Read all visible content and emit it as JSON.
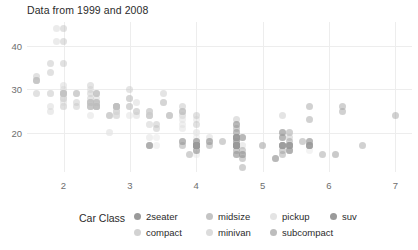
{
  "title": "Data from 1999 and 2008",
  "legend": {
    "title": "Car Class",
    "items": [
      {
        "label": "2seater",
        "color": "#9a9a9a",
        "col": 0,
        "row": 0
      },
      {
        "label": "compact",
        "color": "#d2d2d2",
        "col": 0,
        "row": 1
      },
      {
        "label": "midsize",
        "color": "#c4c4c4",
        "col": 1,
        "row": 0
      },
      {
        "label": "minivan",
        "color": "#dcdcdc",
        "col": 1,
        "row": 1
      },
      {
        "label": "pickup",
        "color": "#e4e4e4",
        "col": 2,
        "row": 0
      },
      {
        "label": "subcompact",
        "color": "#bdbdbd",
        "col": 2,
        "row": 1
      },
      {
        "label": "suv",
        "color": "#9a9a9a",
        "col": 3,
        "row": 0
      }
    ]
  },
  "chart_data": {
    "type": "scatter",
    "title": "Data from 1999 and 2008",
    "xlabel": "",
    "ylabel": "",
    "xlim": [
      1.45,
      7.25
    ],
    "ylim": [
      11.0,
      45.5
    ],
    "xticks": [
      2,
      3,
      4,
      5,
      6,
      7
    ],
    "yticks": [
      20,
      30,
      40
    ],
    "grid": true,
    "legend_position": "bottom",
    "legend_title": "Car Class",
    "point_opacity": 0.45,
    "series": [
      {
        "name": "2seater",
        "color": "#9a9a9a",
        "points": [
          [
            5.7,
            26
          ],
          [
            5.7,
            23
          ],
          [
            6.2,
            26
          ],
          [
            6.2,
            25
          ],
          [
            7.0,
            24
          ]
        ]
      },
      {
        "name": "compact",
        "color": "#d2d2d2",
        "points": [
          [
            1.8,
            29
          ],
          [
            1.8,
            29
          ],
          [
            2.0,
            31
          ],
          [
            2.0,
            30
          ],
          [
            2.8,
            26
          ],
          [
            2.8,
            26
          ],
          [
            3.1,
            27
          ],
          [
            1.8,
            26
          ],
          [
            1.8,
            25
          ],
          [
            2.0,
            28
          ],
          [
            2.0,
            27
          ],
          [
            2.8,
            25
          ],
          [
            2.8,
            25
          ],
          [
            3.1,
            25
          ],
          [
            3.1,
            24
          ],
          [
            2.4,
            27
          ],
          [
            2.4,
            30
          ],
          [
            2.5,
            26
          ],
          [
            2.5,
            29
          ],
          [
            3.3,
            17
          ],
          [
            2.0,
            28
          ],
          [
            2.0,
            29
          ],
          [
            2.0,
            29
          ],
          [
            2.0,
            28
          ],
          [
            2.8,
            24
          ],
          [
            1.9,
            44
          ],
          [
            2.0,
            29
          ],
          [
            2.0,
            26
          ],
          [
            2.5,
            28
          ],
          [
            2.5,
            27
          ],
          [
            2.8,
            24
          ],
          [
            2.8,
            25
          ],
          [
            1.9,
            41
          ],
          [
            2.0,
            26
          ],
          [
            2.0,
            29
          ],
          [
            2.5,
            26
          ],
          [
            2.5,
            26
          ],
          [
            2.8,
            26
          ],
          [
            2.8,
            26
          ],
          [
            3.6,
            24
          ],
          [
            2.4,
            26
          ],
          [
            2.4,
            27
          ]
        ]
      },
      {
        "name": "midsize",
        "color": "#c4c4c4",
        "points": [
          [
            2.4,
            31
          ],
          [
            3.0,
            30
          ],
          [
            3.5,
            29
          ],
          [
            2.2,
            26
          ],
          [
            2.2,
            27
          ],
          [
            2.4,
            26
          ],
          [
            2.4,
            29
          ],
          [
            3.0,
            26
          ],
          [
            3.0,
            28
          ],
          [
            3.5,
            27
          ],
          [
            2.4,
            27
          ],
          [
            2.4,
            28
          ],
          [
            3.1,
            25
          ],
          [
            3.8,
            25
          ],
          [
            3.8,
            24
          ],
          [
            3.8,
            25
          ],
          [
            5.3,
            24
          ],
          [
            2.5,
            27
          ],
          [
            2.5,
            27
          ],
          [
            3.3,
            24
          ],
          [
            3.5,
            27
          ],
          [
            2.0,
            29
          ],
          [
            2.0,
            29
          ],
          [
            2.8,
            26
          ],
          [
            2.8,
            26
          ],
          [
            3.6,
            24
          ],
          [
            2.4,
            27
          ],
          [
            2.4,
            26
          ],
          [
            3.0,
            26
          ],
          [
            3.0,
            28
          ],
          [
            3.3,
            25
          ],
          [
            3.3,
            25
          ]
        ]
      },
      {
        "name": "minivan",
        "color": "#dcdcdc",
        "points": [
          [
            2.4,
            24
          ],
          [
            3.0,
            24
          ],
          [
            3.3,
            22
          ],
          [
            3.3,
            22
          ],
          [
            3.3,
            24
          ],
          [
            3.3,
            24
          ],
          [
            3.3,
            17
          ],
          [
            3.8,
            22
          ],
          [
            3.8,
            21
          ],
          [
            3.8,
            23
          ],
          [
            4.0,
            23
          ],
          [
            3.3,
            19
          ]
        ]
      },
      {
        "name": "pickup",
        "color": "#e4e4e4",
        "points": [
          [
            2.7,
            20
          ],
          [
            2.7,
            20
          ],
          [
            3.4,
            19
          ],
          [
            3.4,
            17
          ],
          [
            4.0,
            20
          ],
          [
            4.0,
            19
          ],
          [
            4.0,
            15
          ],
          [
            4.0,
            20
          ],
          [
            4.6,
            17
          ],
          [
            5.0,
            17
          ],
          [
            4.2,
            19
          ],
          [
            4.2,
            19
          ],
          [
            4.6,
            17
          ],
          [
            4.6,
            18
          ],
          [
            5.4,
            17
          ],
          [
            5.4,
            16
          ],
          [
            4.0,
            18
          ],
          [
            4.0,
            17
          ],
          [
            4.6,
            17
          ],
          [
            5.4,
            16
          ],
          [
            4.7,
            15
          ],
          [
            4.7,
            17
          ],
          [
            4.7,
            17
          ],
          [
            5.7,
            16
          ],
          [
            5.7,
            17
          ],
          [
            6.1,
            15
          ],
          [
            4.0,
            17
          ],
          [
            4.0,
            17
          ],
          [
            4.6,
            16
          ],
          [
            5.4,
            16
          ],
          [
            5.4,
            17
          ],
          [
            4.0,
            17
          ],
          [
            4.0,
            18
          ]
        ]
      },
      {
        "name": "subcompact",
        "color": "#bdbdbd",
        "points": [
          [
            1.6,
            33
          ],
          [
            1.6,
            32
          ],
          [
            1.6,
            32
          ],
          [
            1.6,
            29
          ],
          [
            1.6,
            32
          ],
          [
            1.8,
            34
          ],
          [
            1.8,
            36
          ],
          [
            2.0,
            36
          ],
          [
            2.5,
            29
          ],
          [
            2.5,
            29
          ],
          [
            3.3,
            24
          ],
          [
            2.0,
            44
          ],
          [
            2.0,
            41
          ],
          [
            2.0,
            29
          ],
          [
            2.5,
            26
          ],
          [
            2.5,
            26
          ],
          [
            2.8,
            26
          ],
          [
            2.8,
            26
          ],
          [
            3.6,
            24
          ],
          [
            2.4,
            26
          ],
          [
            2.4,
            27
          ],
          [
            3.8,
            26
          ],
          [
            3.8,
            25
          ],
          [
            4.0,
            24
          ],
          [
            4.0,
            22
          ],
          [
            4.6,
            23
          ],
          [
            5.4,
            20
          ],
          [
            5.4,
            20
          ],
          [
            2.2,
            29
          ],
          [
            2.2,
            29
          ],
          [
            2.5,
            26
          ],
          [
            2.5,
            27
          ],
          [
            4.6,
            20
          ],
          [
            5.4,
            19
          ],
          [
            5.4,
            17
          ],
          [
            2.7,
            24
          ],
          [
            2.7,
            24
          ],
          [
            3.4,
            22
          ],
          [
            3.4,
            21
          ]
        ]
      },
      {
        "name": "suv",
        "color": "#9a9a9a",
        "points": [
          [
            4.7,
            14
          ],
          [
            5.2,
            14
          ],
          [
            3.9,
            15
          ],
          [
            4.7,
            15
          ],
          [
            4.7,
            15
          ],
          [
            4.7,
            16
          ],
          [
            5.2,
            14
          ],
          [
            5.7,
            17
          ],
          [
            5.9,
            15
          ],
          [
            4.0,
            17
          ],
          [
            4.0,
            17
          ],
          [
            4.0,
            17
          ],
          [
            4.0,
            16
          ],
          [
            4.6,
            17
          ],
          [
            5.0,
            17
          ],
          [
            4.2,
            17
          ],
          [
            4.2,
            18
          ],
          [
            4.6,
            17
          ],
          [
            4.6,
            18
          ],
          [
            4.6,
            17
          ],
          [
            5.4,
            17
          ],
          [
            5.4,
            16
          ],
          [
            3.8,
            17
          ],
          [
            3.8,
            18
          ],
          [
            4.0,
            17
          ],
          [
            4.0,
            17
          ],
          [
            4.6,
            17
          ],
          [
            5.4,
            16
          ],
          [
            4.0,
            17
          ],
          [
            4.0,
            18
          ],
          [
            4.6,
            17
          ],
          [
            4.6,
            17
          ],
          [
            4.6,
            18
          ],
          [
            5.4,
            17
          ],
          [
            5.4,
            18
          ],
          [
            3.3,
            17
          ],
          [
            3.3,
            17
          ],
          [
            4.0,
            16
          ],
          [
            5.6,
            18
          ],
          [
            3.8,
            18
          ],
          [
            4.0,
            17
          ],
          [
            4.0,
            18
          ],
          [
            4.0,
            17
          ],
          [
            4.7,
            12
          ],
          [
            4.7,
            19
          ],
          [
            4.7,
            19
          ],
          [
            5.7,
            17
          ],
          [
            5.7,
            17
          ],
          [
            6.1,
            15
          ],
          [
            4.0,
            17
          ],
          [
            4.2,
            18
          ],
          [
            4.4,
            18
          ],
          [
            4.6,
            19
          ],
          [
            5.4,
            17
          ],
          [
            5.4,
            17
          ],
          [
            5.3,
            20
          ],
          [
            5.3,
            20
          ],
          [
            5.3,
            19
          ],
          [
            5.3,
            17
          ],
          [
            5.3,
            17
          ],
          [
            5.3,
            19
          ],
          [
            5.3,
            15
          ],
          [
            5.3,
            16
          ],
          [
            5.3,
            17
          ],
          [
            5.3,
            17
          ],
          [
            5.3,
            17
          ],
          [
            5.7,
            17
          ],
          [
            5.7,
            18
          ],
          [
            5.7,
            18
          ],
          [
            6.5,
            17
          ],
          [
            4.6,
            22
          ],
          [
            4.6,
            21
          ],
          [
            4.6,
            22
          ],
          [
            4.6,
            19
          ],
          [
            4.6,
            20
          ],
          [
            4.6,
            19
          ],
          [
            4.6,
            19
          ],
          [
            4.6,
            16
          ],
          [
            4.6,
            15
          ],
          [
            4.6,
            15
          ],
          [
            4.6,
            17
          ],
          [
            4.6,
            17
          ],
          [
            4.6,
            19
          ],
          [
            4.6,
            19
          ]
        ]
      }
    ]
  }
}
